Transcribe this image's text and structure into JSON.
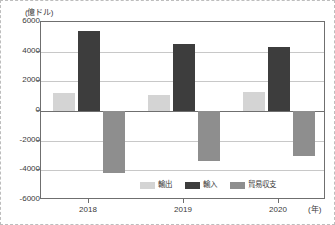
{
  "chart_data": {
    "type": "bar",
    "title": "",
    "subtitle": "",
    "xlabel": "(年)",
    "ylabel": "(億ドル)",
    "categories": [
      "2018",
      "2019",
      "2020"
    ],
    "series": [
      {
        "name": "輸出",
        "color": "#d4d4d4",
        "values": [
          1200,
          1100,
          1300
        ]
      },
      {
        "name": "輸入",
        "color": "#3d3d3d",
        "values": [
          5400,
          4500,
          4300
        ]
      },
      {
        "name": "貿易収支",
        "color": "#8e8e8e",
        "values": [
          -4200,
          -3400,
          -3000
        ]
      }
    ],
    "ylim": [
      -6000,
      6000
    ],
    "ytick_values": [
      6000,
      4000,
      2000,
      0,
      -2000,
      -4000,
      -6000
    ],
    "ytick_labels": [
      "6000",
      "4000",
      "2000",
      "0",
      "-2000",
      "-4000",
      "-6000"
    ],
    "grid": true,
    "legend_position": "bottom-center"
  },
  "axes": {
    "y_unit": "(億ドル)",
    "x_unit": "(年)"
  },
  "legend": {
    "items": [
      {
        "label": "輸出"
      },
      {
        "label": "輸入"
      },
      {
        "label": "貿易収支"
      }
    ]
  }
}
